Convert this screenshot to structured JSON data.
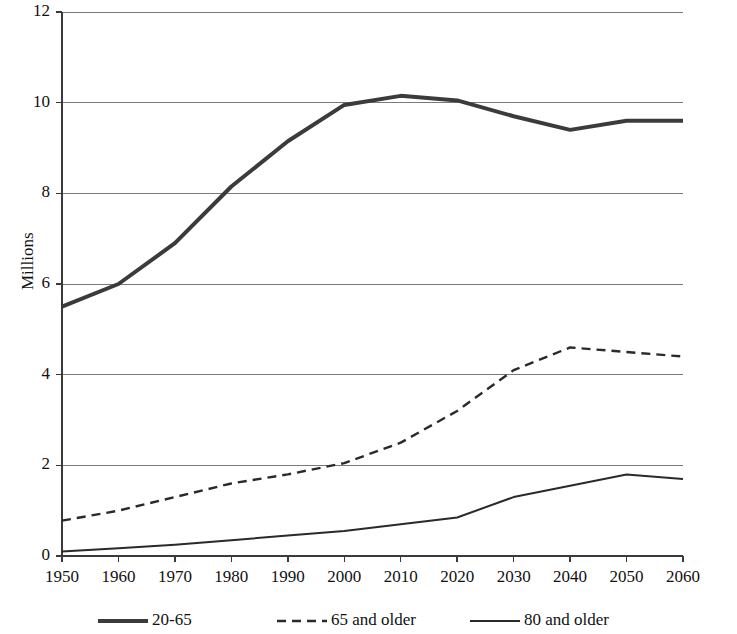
{
  "chart_data": {
    "type": "line",
    "title": "",
    "xlabel": "",
    "ylabel": "Millions",
    "x": [
      1950,
      1960,
      1970,
      1980,
      1990,
      2000,
      2010,
      2020,
      2030,
      2040,
      2050,
      2060
    ],
    "xtick_labels": [
      "1950",
      "1960",
      "1970",
      "1980",
      "1990",
      "2000",
      "2010",
      "2020",
      "2030",
      "2040",
      "2050",
      "2060"
    ],
    "ytick_labels": [
      "0",
      "2",
      "4",
      "6",
      "8",
      "10",
      "12"
    ],
    "yticks": [
      0,
      2,
      4,
      6,
      8,
      10,
      12
    ],
    "ylim": [
      0,
      12
    ],
    "xlim": [
      1950,
      2060
    ],
    "grid": "horizontal",
    "legend_position": "bottom",
    "series": [
      {
        "name": "20-65",
        "style": "solid-thick",
        "color": "#3b3b3b",
        "width": 4,
        "values": [
          5.5,
          6.0,
          6.9,
          8.15,
          9.15,
          9.95,
          10.15,
          10.05,
          9.7,
          9.4,
          9.6,
          9.6
        ]
      },
      {
        "name": "65 and older",
        "style": "dashed",
        "color": "#2a2a2a",
        "width": 2.4,
        "values": [
          0.78,
          1.0,
          1.3,
          1.6,
          1.8,
          2.05,
          2.5,
          3.2,
          4.1,
          4.6,
          4.5,
          4.4
        ]
      },
      {
        "name": "80 and older",
        "style": "solid-thin",
        "color": "#2a2a2a",
        "width": 2,
        "values": [
          0.1,
          0.17,
          0.25,
          0.35,
          0.45,
          0.55,
          0.7,
          0.85,
          1.3,
          1.55,
          1.8,
          1.7
        ]
      }
    ],
    "gridline_color": "#7a7a7a",
    "axis_color": "#3a3a3a"
  },
  "legend": {
    "items": [
      {
        "label": "20-65"
      },
      {
        "label": "65 and older"
      },
      {
        "label": "80 and older"
      }
    ]
  }
}
